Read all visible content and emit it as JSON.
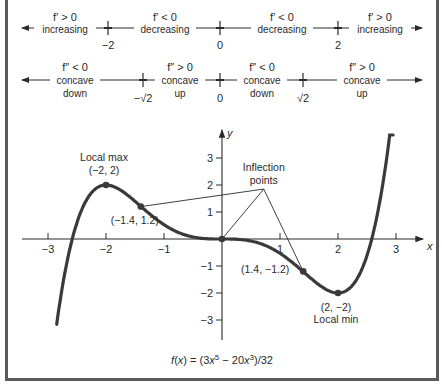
{
  "sign_chart_first_derivative": {
    "line_y": 28,
    "x_start": 22,
    "x_end": 422,
    "critical_points": [
      {
        "label": "−2",
        "x": 108
      },
      {
        "label": "0",
        "x": 220
      },
      {
        "label": "2",
        "x": 338
      }
    ],
    "intervals": [
      {
        "condition": "f′ > 0",
        "description": "increasing",
        "x": 65
      },
      {
        "condition": "f′ < 0",
        "description": "decreasing",
        "x": 165
      },
      {
        "condition": "f′ < 0",
        "description": "decreasing",
        "x": 282
      },
      {
        "condition": "f′ > 0",
        "description": "increasing",
        "x": 380
      }
    ]
  },
  "sign_chart_second_derivative": {
    "line_y": 80,
    "x_start": 22,
    "x_end": 422,
    "critical_points": [
      {
        "label": "−√2",
        "x": 143
      },
      {
        "label": "0",
        "x": 220
      },
      {
        "label": "√2",
        "x": 303
      }
    ],
    "intervals": [
      {
        "condition": "f″ < 0",
        "line1": "concave",
        "line2": "down",
        "x": 75
      },
      {
        "condition": "f″ > 0",
        "line1": "concave",
        "line2": "up",
        "x": 180
      },
      {
        "condition": "f″ < 0",
        "line1": "concave",
        "line2": "down",
        "x": 262
      },
      {
        "condition": "f″ > 0",
        "line1": "concave",
        "line2": "up",
        "x": 362
      }
    ]
  },
  "chart_data": {
    "type": "line",
    "caption_parts": {
      "f": "f",
      "paren_open": "(",
      "x": "x",
      "rest1": ") = (3",
      "x2": "x",
      "sup1": "5",
      "mid": " − 20",
      "x3": "x",
      "sup2": "3",
      "end": ")/32"
    },
    "function": {
      "expression": "(3x^5 - 20x^3)/32",
      "coefficients": {
        "x5": 3,
        "x3": -20,
        "denominator": 32
      }
    },
    "xlabel": "x",
    "ylabel": "y",
    "xlim": [
      -3.45,
      3.45
    ],
    "ylim": [
      -3.8,
      4.0
    ],
    "x_ticks": [
      -3,
      -2,
      -1,
      1,
      2,
      3
    ],
    "x_tick_labels": [
      "−3",
      "−2",
      "−1",
      "1",
      "2",
      "3"
    ],
    "y_ticks": [
      3,
      2,
      1,
      -1,
      -2,
      -3
    ],
    "y_tick_labels": [
      "3",
      "2",
      "1",
      "−1",
      "−2",
      "−3"
    ],
    "grid": false,
    "legend": null,
    "plot_domain": [
      -2.85,
      2.95
    ],
    "key_points": [
      {
        "x": -2,
        "y": 2,
        "label": "(−2, 2)",
        "annotation": "Local max",
        "type": "local-max"
      },
      {
        "x": -1.4,
        "y": 1.2,
        "label": "(−1.4, 1.2)",
        "type": "inflection"
      },
      {
        "x": 0,
        "y": 0,
        "label": "",
        "type": "inflection"
      },
      {
        "x": 1.4,
        "y": -1.2,
        "label": "(1.4, −1.2)",
        "type": "inflection"
      },
      {
        "x": 2,
        "y": -2,
        "label": "(2, −2)",
        "annotation": "Local min",
        "type": "local-min"
      }
    ],
    "annotations": [
      {
        "text_line1": "Inflection",
        "text_line2": "points",
        "anchor_x": 0.72,
        "anchor_y": 1.85
      }
    ],
    "pixel_mapping": {
      "origin_x": 222,
      "origin_y": 239,
      "unit_x": 58,
      "unit_y": 27
    }
  }
}
